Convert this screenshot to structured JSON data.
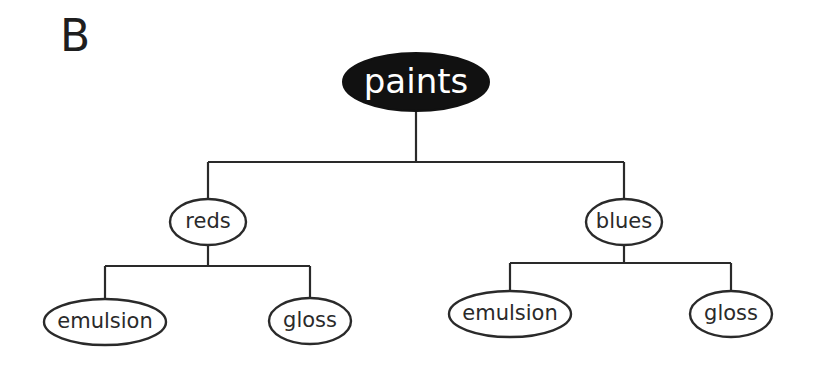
{
  "panel_label": "B",
  "tree": {
    "root": {
      "label": "paints",
      "cx": 416,
      "cy": 82,
      "rx": 73,
      "ry": 29,
      "style": "filled",
      "fill": "#111111",
      "text_color": "#ffffff"
    },
    "children": [
      {
        "label": "reds",
        "cx": 208,
        "cy": 222,
        "rx": 38,
        "ry": 23,
        "children": [
          {
            "label": "emulsion",
            "cx": 105,
            "cy": 322,
            "rx": 61,
            "ry": 23
          },
          {
            "label": "gloss",
            "cx": 310,
            "cy": 321,
            "rx": 41,
            "ry": 23
          }
        ]
      },
      {
        "label": "blues",
        "cx": 624,
        "cy": 222,
        "rx": 38,
        "ry": 23,
        "children": [
          {
            "label": "emulsion",
            "cx": 510,
            "cy": 314,
            "rx": 61,
            "ry": 23
          },
          {
            "label": "gloss",
            "cx": 731,
            "cy": 314,
            "rx": 41,
            "ry": 23
          }
        ]
      }
    ]
  },
  "connectors": {
    "root_bar_y": 162,
    "reds_bar_y": 266,
    "blues_bar_y": 263
  },
  "colors": {
    "line": "#2a2a2a",
    "root_fill": "#111111",
    "node_fill": "#ffffff",
    "background": "#ffffff"
  }
}
